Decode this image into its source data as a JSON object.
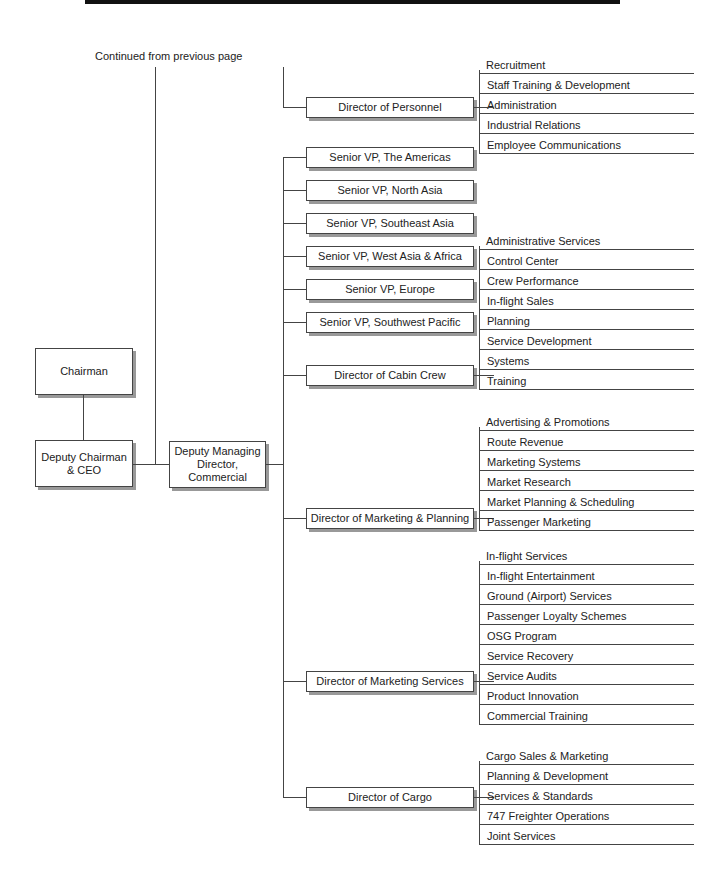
{
  "header": {
    "continued_note": "Continued from previous page"
  },
  "executives": {
    "chairman": "Chairman",
    "deputy_chairman": "Deputy Chairman & CEO",
    "deputy_chairman_line1": "Deputy Chairman",
    "deputy_chairman_line2": "& CEO",
    "deputy_md_line1": "Deputy Managing",
    "deputy_md_line2": "Director, Commercial"
  },
  "units": [
    {
      "title": "Director of Personnel",
      "departments": [
        "Recruitment",
        "Staff Training & Development",
        "Administration",
        "Industrial Relations",
        "Employee Communications"
      ]
    },
    {
      "title": "Senior VP, The Americas",
      "departments": []
    },
    {
      "title": "Senior VP, North Asia",
      "departments": []
    },
    {
      "title": "Senior VP, Southeast Asia",
      "departments": []
    },
    {
      "title": "Senior VP, West Asia & Africa",
      "departments": []
    },
    {
      "title": "Senior VP, Europe",
      "departments": []
    },
    {
      "title": "Senior VP, Southwest Pacific",
      "departments": []
    },
    {
      "title": "Director of Cabin Crew",
      "departments": [
        "Administrative Services",
        "Control Center",
        "Crew Performance",
        "In-flight Sales",
        "Planning",
        "Service Development",
        "Systems",
        "Training"
      ]
    },
    {
      "title": "Director of Marketing & Planning",
      "departments": [
        "Advertising & Promotions",
        "Route Revenue",
        "Marketing Systems",
        "Market Research",
        "Market Planning & Scheduling",
        "Passenger Marketing"
      ]
    },
    {
      "title": "Director of Marketing Services",
      "departments": [
        "In-flight Services",
        "In-flight Entertainment",
        "Ground (Airport) Services",
        "Passenger Loyalty Schemes",
        "OSG Program",
        "Service Recovery",
        "Service Audits",
        "Product Innovation",
        "Commercial Training"
      ]
    },
    {
      "title": "Director of Cargo",
      "departments": [
        "Cargo Sales & Marketing",
        "Planning & Development",
        "Services & Standards",
        "747 Freighter Operations",
        "Joint Services"
      ]
    }
  ]
}
